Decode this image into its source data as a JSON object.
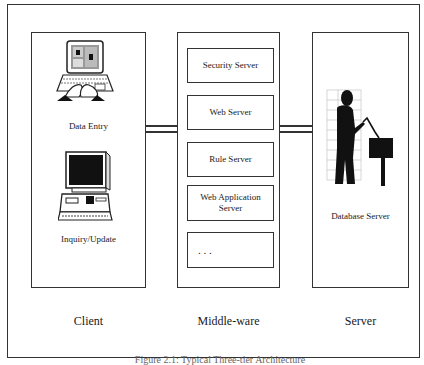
{
  "diagram": {
    "columns": [
      {
        "id": "client",
        "label": "Client"
      },
      {
        "id": "middleware",
        "label": "Middle-ware"
      },
      {
        "id": "server",
        "label": "Server"
      }
    ],
    "client": {
      "nodes": [
        {
          "label": "Data Entry",
          "icon": "laptop-typing-icon"
        },
        {
          "label": "Inquiry/Update",
          "icon": "desktop-computer-icon"
        }
      ]
    },
    "middleware": {
      "servers": [
        {
          "label": "Security Server"
        },
        {
          "label": "Web Server"
        },
        {
          "label": "Rule Server"
        },
        {
          "label": "Web Application Server"
        },
        {
          "label": ". . ."
        }
      ]
    },
    "server": {
      "nodes": [
        {
          "label": "Database Server",
          "icon": "person-at-terminal-icon"
        }
      ]
    },
    "connections": [
      {
        "from": "client",
        "to": "middleware"
      },
      {
        "from": "middleware",
        "to": "server"
      }
    ],
    "caption": "Figure 2.1: Typical Three-tier Architecture"
  }
}
